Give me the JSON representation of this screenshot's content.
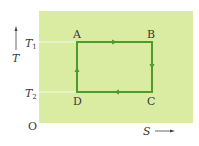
{
  "diagram": {
    "type": "T-S diagram (Carnot cycle)",
    "panel_color": "#d9eca2",
    "cycle_color": "#4e9b2c",
    "axes": {
      "y_label": "T",
      "x_label": "S",
      "origin_label": "O",
      "y_ticks": [
        {
          "label": "T",
          "sub": "1"
        },
        {
          "label": "T",
          "sub": "2"
        }
      ]
    },
    "points": [
      {
        "name": "A",
        "position": "top-left"
      },
      {
        "name": "B",
        "position": "top-right"
      },
      {
        "name": "C",
        "position": "bottom-right"
      },
      {
        "name": "D",
        "position": "bottom-left"
      }
    ],
    "path": [
      "A",
      "B",
      "C",
      "D",
      "A"
    ],
    "direction": "clockwise"
  }
}
